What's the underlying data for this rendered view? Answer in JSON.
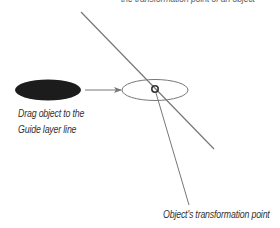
{
  "diagram": {
    "labels": {
      "top_caption": "the transformation point of an object",
      "drag_instruction_line1": "Drag object to the",
      "drag_instruction_line2": "Guide layer line",
      "transformation_point": "Object's transformation point"
    },
    "shapes": {
      "source_object": {
        "type": "filled-ellipse",
        "cx": 48,
        "cy": 90,
        "rx": 33,
        "ry": 10.5,
        "fill": "#1a1a1a",
        "texture": "dotted"
      },
      "drag_arrow": {
        "x1": 85,
        "y1": 90,
        "x2": 122,
        "y2": 90,
        "color": "#777777"
      },
      "target_object": {
        "type": "outline-ellipse",
        "cx": 155,
        "cy": 90,
        "rx": 33,
        "ry": 10.5,
        "stroke": "#777777"
      },
      "transformation_point_marker": {
        "cx": 155,
        "cy": 89,
        "r": 3.2,
        "stroke": "#333333"
      },
      "guide_line": {
        "x1": 81,
        "y1": 12,
        "x2": 214,
        "y2": 149,
        "color": "#777777"
      },
      "callout_line": {
        "x1": 156,
        "y1": 92,
        "x2": 189,
        "y2": 205,
        "color": "#777777"
      }
    },
    "colors": {
      "line": "#777777",
      "text": "#333333",
      "object_fill": "#1a1a1a",
      "background": "#ffffff"
    }
  }
}
